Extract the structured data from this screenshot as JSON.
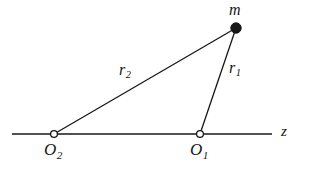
{
  "figure": {
    "kind": "geometry-diagram",
    "background_color": "#ffffff",
    "stroke_color": "#171717",
    "width": 310,
    "height": 176
  },
  "axis": {
    "name": "z-axis",
    "label": "z",
    "y": 134,
    "x_start": 12,
    "x_end": 272,
    "stroke_width": 1.4
  },
  "points": [
    {
      "id": "m",
      "label": "m",
      "marker": "filled-circle",
      "x": 236,
      "y": 28,
      "radius": 5.2,
      "fill": "#171717"
    },
    {
      "id": "O1",
      "label": "O",
      "subscript": "1",
      "marker": "open-circle",
      "x": 200,
      "y": 134,
      "radius": 3.4,
      "fill": "#ffffff"
    },
    {
      "id": "O2",
      "label": "O",
      "subscript": "2",
      "marker": "open-circle",
      "x": 54,
      "y": 134,
      "radius": 3.4,
      "fill": "#ffffff"
    }
  ],
  "segments": [
    {
      "id": "r1",
      "label": "r",
      "subscript": "1",
      "from": "O1",
      "to": "m",
      "x1": 200,
      "y1": 134,
      "x2": 236,
      "y2": 28,
      "stroke_width": 1.3
    },
    {
      "id": "r2",
      "label": "r",
      "subscript": "2",
      "from": "O2",
      "to": "m",
      "x1": 54,
      "y1": 134,
      "x2": 236,
      "y2": 28,
      "stroke_width": 1.3
    }
  ],
  "labels": {
    "m": "m",
    "r1_base": "r",
    "r1_sub": "1",
    "r2_base": "r",
    "r2_sub": "2",
    "o1_base": "O",
    "o1_sub": "1",
    "o2_base": "O",
    "o2_sub": "2",
    "z": "z"
  }
}
